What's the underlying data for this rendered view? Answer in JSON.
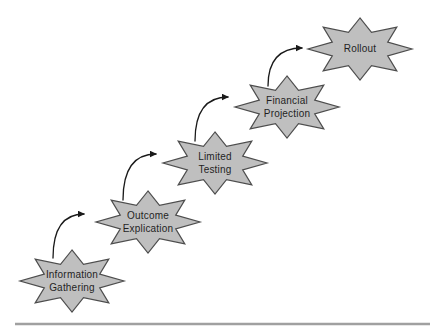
{
  "colors": {
    "background": "#ffffff",
    "star_fill": "#bfbfbf",
    "star_stroke": "#4d4d4d",
    "label_color": "#1f1f1f",
    "arrow_color": "#1a1a1a",
    "rule_color": "#a0a0a0"
  },
  "diagram": {
    "stages": [
      {
        "label": "Information\nGathering"
      },
      {
        "label": "Outcome\nExplication"
      },
      {
        "label": "Limited\nTesting"
      },
      {
        "label": "Financial\nProjection"
      },
      {
        "label": "Rollout"
      }
    ]
  }
}
